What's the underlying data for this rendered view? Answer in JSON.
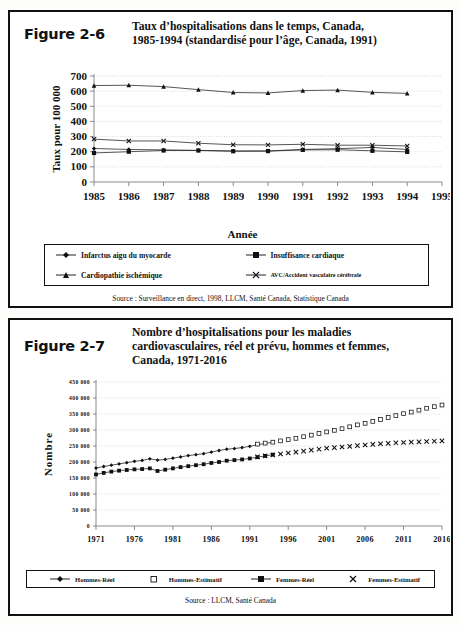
{
  "figure_26": {
    "label": "Figure 2-6",
    "title_line1": "Taux d’hospitalisations dans le temps, Canada,",
    "title_line2": "1985-1994 (standardisé pour l’âge, Canada, 1991)",
    "xaxis_caption": "Année",
    "source": "Source :  Surveillance en direct, 1998, LLCM, Santé Canada, Statistique Canada",
    "legend": [
      {
        "label": "Infarctus aigu du myocarde",
        "marker": "diamond"
      },
      {
        "label": "Insuffisance cardiaque",
        "marker": "square"
      },
      {
        "label": "Cardiopathie ischémique",
        "marker": "triangle"
      },
      {
        "label": "AVC/Accident vasculaire cérébrale",
        "marker": "cross"
      }
    ]
  },
  "figure_27": {
    "label": "Figure 2-7",
    "title_line1": "Nombre d’hospitalisations pour les maladies",
    "title_line2": "cardiovasculaires, réel et prévu, hommes et femmes,",
    "title_line3": "Canada, 1971-2016",
    "source": "Source : LLCM, Santé Canada",
    "legend": [
      {
        "label": "Hommes-Réel",
        "marker": "diamond-line"
      },
      {
        "label": "Hommes-Estimatif",
        "marker": "open-square"
      },
      {
        "label": "Femmes-Réel",
        "marker": "square-line"
      },
      {
        "label": "Femmes-Estimatif",
        "marker": "cross"
      }
    ]
  },
  "chart_data": [
    {
      "type": "line",
      "id": "figure-2-6",
      "title": "Taux d’hospitalisations dans le temps, Canada, 1985-1994 (standardisé pour l’âge, Canada, 1991)",
      "xlabel": "Année",
      "ylabel": "Taux pour 100 000",
      "x": [
        1985,
        1986,
        1987,
        1988,
        1989,
        1990,
        1991,
        1992,
        1993,
        1994
      ],
      "xticks": [
        1985,
        1986,
        1987,
        1988,
        1989,
        1990,
        1991,
        1992,
        1993,
        1994,
        1995
      ],
      "yticks": [
        0,
        100,
        200,
        300,
        400,
        500,
        600,
        700
      ],
      "ylim": [
        0,
        700
      ],
      "xlim": [
        1985,
        1995
      ],
      "grid": true,
      "legend_position": "below",
      "series": [
        {
          "name": "Cardiopathie ischémique",
          "marker": "triangle",
          "values": [
            637,
            639,
            630,
            610,
            591,
            588,
            604,
            607,
            592,
            585
          ]
        },
        {
          "name": "AVC/Accident vasculaire cérébrale",
          "marker": "cross",
          "values": [
            283,
            271,
            271,
            256,
            246,
            245,
            249,
            243,
            243,
            238
          ]
        },
        {
          "name": "Infarctus aigu du myocarde",
          "marker": "diamond",
          "values": [
            221,
            215,
            212,
            209,
            205,
            205,
            215,
            220,
            228,
            215
          ]
        },
        {
          "name": "Insuffisance cardiaque",
          "marker": "square",
          "values": [
            192,
            200,
            208,
            208,
            203,
            204,
            212,
            213,
            206,
            199
          ]
        }
      ]
    },
    {
      "type": "line",
      "id": "figure-2-7",
      "title": "Nombre d’hospitalisations pour les maladies cardiovasculaires, réel et prévu, hommes et femmes, Canada, 1971-2016",
      "xlabel": "",
      "ylabel": "Nombre",
      "xticks": [
        1971,
        1976,
        1981,
        1986,
        1991,
        1996,
        2001,
        2006,
        2011,
        2016
      ],
      "yticks": [
        0,
        50000,
        100000,
        150000,
        200000,
        250000,
        300000,
        350000,
        400000,
        450000
      ],
      "ytick_labels": [
        "0",
        "50 000",
        "100 000",
        "150 000",
        "200 000",
        "250 000",
        "300 000",
        "350 000",
        "400 000",
        "450 000"
      ],
      "ylim": [
        0,
        450000
      ],
      "xlim": [
        1971,
        2016
      ],
      "grid": true,
      "legend_position": "below",
      "series": [
        {
          "name": "Hommes-Réel",
          "marker": "diamond",
          "x": [
            1971,
            1972,
            1973,
            1974,
            1975,
            1976,
            1977,
            1978,
            1979,
            1980,
            1981,
            1982,
            1983,
            1984,
            1985,
            1986,
            1987,
            1988,
            1989,
            1990,
            1991,
            1992,
            1993,
            1994
          ],
          "values": [
            181000,
            186000,
            190000,
            194000,
            198000,
            202000,
            205000,
            210000,
            206000,
            208000,
            212000,
            216000,
            220000,
            223000,
            226000,
            231000,
            236000,
            240000,
            242000,
            245000,
            249000,
            254000,
            258000,
            262000
          ]
        },
        {
          "name": "Hommes-Estimatif",
          "marker": "open-square",
          "x": [
            1992,
            1993,
            1994,
            1995,
            1996,
            1997,
            1998,
            1999,
            2000,
            2001,
            2002,
            2003,
            2004,
            2005,
            2006,
            2007,
            2008,
            2009,
            2010,
            2011,
            2012,
            2013,
            2014,
            2015,
            2016
          ],
          "values": [
            256000,
            259000,
            262000,
            266000,
            270000,
            274000,
            279000,
            284000,
            289000,
            294000,
            299000,
            304000,
            310000,
            316000,
            321000,
            327000,
            333000,
            339000,
            345000,
            351000,
            356000,
            362000,
            368000,
            373000,
            378000
          ]
        },
        {
          "name": "Femmes-Réel",
          "marker": "square",
          "x": [
            1971,
            1972,
            1973,
            1974,
            1975,
            1976,
            1977,
            1978,
            1979,
            1980,
            1981,
            1982,
            1983,
            1984,
            1985,
            1986,
            1987,
            1988,
            1989,
            1990,
            1991,
            1992,
            1993,
            1994
          ],
          "values": [
            161000,
            166000,
            170000,
            173000,
            175000,
            177000,
            178000,
            180000,
            172000,
            176000,
            180000,
            184000,
            187000,
            190000,
            193000,
            197000,
            200000,
            204000,
            206000,
            208000,
            211000,
            215000,
            219000,
            223000
          ]
        },
        {
          "name": "Femmes-Estimatif",
          "marker": "cross",
          "x": [
            1992,
            1993,
            1994,
            1995,
            1996,
            1997,
            1998,
            1999,
            2000,
            2001,
            2002,
            2003,
            2004,
            2005,
            2006,
            2007,
            2008,
            2009,
            2010,
            2011,
            2012,
            2013,
            2014,
            2015,
            2016
          ],
          "values": [
            216000,
            219000,
            222000,
            225000,
            228000,
            231000,
            234000,
            237000,
            240000,
            243000,
            245000,
            247000,
            249000,
            251000,
            253000,
            255000,
            257000,
            258000,
            260000,
            261000,
            262000,
            263000,
            264000,
            265000,
            266000
          ]
        }
      ]
    }
  ]
}
